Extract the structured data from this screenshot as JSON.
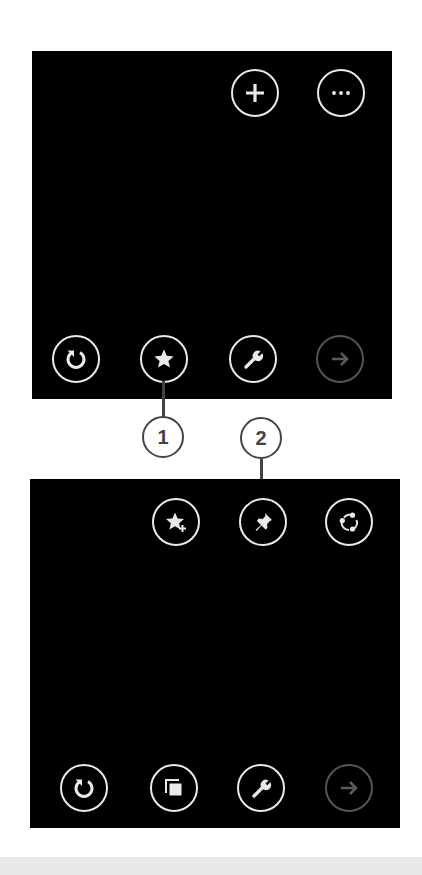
{
  "colors": {
    "panel_bg": "#000000",
    "icon_active": "#eaeaea",
    "icon_disabled": "#555555",
    "callout": "#444444",
    "page_bg": "#ffffff",
    "bottom_band": "#e8e8e8"
  },
  "top_panel": {
    "top_buttons": [
      {
        "icon": "plus-icon",
        "label": "New tab"
      },
      {
        "icon": "more-icon",
        "label": "More"
      }
    ],
    "bottom_buttons": [
      {
        "icon": "refresh-icon",
        "label": "Refresh"
      },
      {
        "icon": "star-icon",
        "label": "Favorites"
      },
      {
        "icon": "wrench-icon",
        "label": "Page tools"
      },
      {
        "icon": "forward-arrow-icon",
        "label": "Forward",
        "disabled": true
      }
    ]
  },
  "bottom_panel": {
    "top_buttons": [
      {
        "icon": "star-add-icon",
        "label": "Add to favorites"
      },
      {
        "icon": "pin-icon",
        "label": "Pin to Start"
      },
      {
        "icon": "share-icon",
        "label": "Share"
      }
    ],
    "bottom_buttons": [
      {
        "icon": "refresh-icon",
        "label": "Refresh"
      },
      {
        "icon": "tabs-icon",
        "label": "Tabs"
      },
      {
        "icon": "wrench-icon",
        "label": "Page tools"
      },
      {
        "icon": "forward-arrow-icon",
        "label": "Forward",
        "disabled": true
      }
    ]
  },
  "callouts": [
    {
      "number": "1",
      "target": "Favorites"
    },
    {
      "number": "2",
      "target": "Pin to Start"
    }
  ]
}
